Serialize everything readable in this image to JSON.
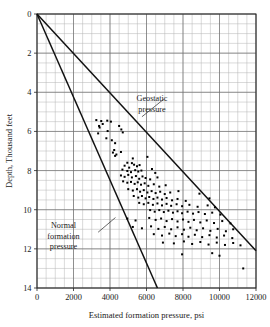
{
  "chart_data": {
    "type": "scatter",
    "title": "",
    "xlabel": "Estimated formation pressure, psi",
    "ylabel": "Depth, Thousand feet",
    "xlim": [
      0,
      12000
    ],
    "ylim": [
      0,
      14
    ],
    "y_inverted": true,
    "grid": true,
    "grid_major_x": [
      0,
      2000,
      4000,
      6000,
      8000,
      10000,
      12000
    ],
    "grid_minor_x_step": 500,
    "grid_major_y": [
      0,
      2,
      4,
      6,
      8,
      10,
      12,
      14
    ],
    "grid_minor_y_step": 0.5,
    "xticks": [
      "0",
      "2000",
      "4000",
      "6000",
      "8000",
      "10000",
      "12000"
    ],
    "yticks": [
      "0",
      "2",
      "4",
      "6",
      "8",
      "10",
      "12",
      "14"
    ],
    "legend_position": "inline-annotations",
    "annotations": [
      {
        "name": "geostatic-pressure-label",
        "text_lines": [
          "Geostatic",
          "pressure"
        ],
        "text_x": 6300,
        "text_y": 4.45,
        "leader_from_x": 5750,
        "leader_from_y": 5.25,
        "leader_to_x": 6950,
        "leader_to_y": 4.35
      },
      {
        "name": "normal-formation-pressure-label",
        "text_lines": [
          "Normal",
          "formation",
          "pressure"
        ],
        "text_x": 1450,
        "text_y": 10.95,
        "leader_from_x": 4300,
        "leader_from_y": 10.4,
        "leader_to_x": 3350,
        "leader_to_y": 11.15
      }
    ],
    "series": [
      {
        "name": "Geostatic pressure",
        "type": "line",
        "points": [
          [
            0,
            0
          ],
          [
            12000,
            12.1
          ]
        ]
      },
      {
        "name": "Normal formation pressure",
        "type": "line",
        "points": [
          [
            0,
            0
          ],
          [
            6600,
            14.0
          ]
        ]
      },
      {
        "name": "Estimated formation pressure data",
        "type": "scatter",
        "marker": "square",
        "points": [
          [
            3250,
            5.42
          ],
          [
            3520,
            5.47
          ],
          [
            3850,
            5.45
          ],
          [
            4050,
            5.5
          ],
          [
            3400,
            5.72
          ],
          [
            3430,
            5.8
          ],
          [
            3600,
            5.62
          ],
          [
            4500,
            5.72
          ],
          [
            3350,
            6.1
          ],
          [
            3870,
            5.98
          ],
          [
            4620,
            5.9
          ],
          [
            4700,
            6.05
          ],
          [
            3800,
            6.35
          ],
          [
            4100,
            6.45
          ],
          [
            4280,
            6.6
          ],
          [
            4230,
            6.95
          ],
          [
            4160,
            7.08
          ],
          [
            4280,
            7.25
          ],
          [
            4350,
            7.18
          ],
          [
            4600,
            7.05
          ],
          [
            5250,
            7.38
          ],
          [
            6050,
            7.3
          ],
          [
            4950,
            7.6
          ],
          [
            5200,
            7.62
          ],
          [
            4800,
            7.75
          ],
          [
            5050,
            7.85
          ],
          [
            5320,
            7.7
          ],
          [
            5480,
            7.78
          ],
          [
            5620,
            7.72
          ],
          [
            4680,
            7.95
          ],
          [
            4950,
            8.02
          ],
          [
            5150,
            8.08
          ],
          [
            5380,
            7.98
          ],
          [
            5550,
            8.05
          ],
          [
            5720,
            8.0
          ],
          [
            6300,
            7.92
          ],
          [
            6480,
            8.12
          ],
          [
            4600,
            8.25
          ],
          [
            4800,
            8.32
          ],
          [
            5000,
            8.22
          ],
          [
            5200,
            8.35
          ],
          [
            5420,
            8.28
          ],
          [
            5600,
            8.42
          ],
          [
            5780,
            8.3
          ],
          [
            5950,
            8.38
          ],
          [
            6200,
            8.45
          ],
          [
            6600,
            8.35
          ],
          [
            4720,
            8.55
          ],
          [
            4950,
            8.62
          ],
          [
            5150,
            8.58
          ],
          [
            5350,
            8.68
          ],
          [
            5520,
            8.6
          ],
          [
            5700,
            8.72
          ],
          [
            5900,
            8.65
          ],
          [
            6100,
            8.78
          ],
          [
            6400,
            8.7
          ],
          [
            6700,
            8.82
          ],
          [
            7050,
            8.75
          ],
          [
            5000,
            8.95
          ],
          [
            5250,
            9.02
          ],
          [
            5480,
            8.95
          ],
          [
            5650,
            9.08
          ],
          [
            5850,
            9.0
          ],
          [
            6050,
            9.12
          ],
          [
            6280,
            9.05
          ],
          [
            6500,
            9.15
          ],
          [
            6750,
            9.08
          ],
          [
            7000,
            9.2
          ],
          [
            7300,
            9.12
          ],
          [
            7750,
            9.05
          ],
          [
            8900,
            9.18
          ],
          [
            5300,
            9.3
          ],
          [
            5550,
            9.38
          ],
          [
            5750,
            9.3
          ],
          [
            5950,
            9.42
          ],
          [
            6150,
            9.35
          ],
          [
            6380,
            9.45
          ],
          [
            6600,
            9.38
          ],
          [
            6850,
            9.48
          ],
          [
            7100,
            9.4
          ],
          [
            7400,
            9.52
          ],
          [
            7700,
            9.45
          ],
          [
            8150,
            9.55
          ],
          [
            9450,
            9.42
          ],
          [
            5600,
            9.65
          ],
          [
            5850,
            9.72
          ],
          [
            6100,
            9.65
          ],
          [
            6350,
            9.75
          ],
          [
            6600,
            9.68
          ],
          [
            6850,
            9.78
          ],
          [
            7100,
            9.7
          ],
          [
            7350,
            9.8
          ],
          [
            7650,
            9.72
          ],
          [
            7950,
            9.82
          ],
          [
            8350,
            9.75
          ],
          [
            8800,
            9.85
          ],
          [
            9350,
            9.78
          ],
          [
            9750,
            9.88
          ],
          [
            6200,
            10.02
          ],
          [
            6450,
            10.1
          ],
          [
            6700,
            10.02
          ],
          [
            6950,
            10.12
          ],
          [
            7200,
            10.05
          ],
          [
            7450,
            10.15
          ],
          [
            7700,
            10.08
          ],
          [
            7950,
            10.18
          ],
          [
            8250,
            10.1
          ],
          [
            8550,
            10.2
          ],
          [
            8850,
            10.12
          ],
          [
            9200,
            10.22
          ],
          [
            9600,
            10.15
          ],
          [
            10050,
            10.25
          ],
          [
            4950,
            10.45
          ],
          [
            5400,
            10.55
          ],
          [
            6150,
            10.42
          ],
          [
            6500,
            10.52
          ],
          [
            6800,
            10.45
          ],
          [
            7100,
            10.58
          ],
          [
            7400,
            10.48
          ],
          [
            7700,
            10.6
          ],
          [
            8000,
            10.5
          ],
          [
            8300,
            10.62
          ],
          [
            8600,
            10.52
          ],
          [
            8950,
            10.65
          ],
          [
            9300,
            10.55
          ],
          [
            9700,
            10.68
          ],
          [
            10150,
            10.58
          ],
          [
            10600,
            10.7
          ],
          [
            5250,
            10.88
          ],
          [
            5750,
            10.95
          ],
          [
            6250,
            10.85
          ],
          [
            6650,
            10.98
          ],
          [
            7000,
            10.88
          ],
          [
            7350,
            11.0
          ],
          [
            7700,
            10.9
          ],
          [
            8050,
            11.02
          ],
          [
            8400,
            10.92
          ],
          [
            8750,
            11.05
          ],
          [
            9100,
            10.95
          ],
          [
            9500,
            11.08
          ],
          [
            9900,
            10.98
          ],
          [
            10350,
            11.1
          ],
          [
            10750,
            11.0
          ],
          [
            6400,
            11.25
          ],
          [
            6850,
            11.32
          ],
          [
            7250,
            11.22
          ],
          [
            7600,
            11.35
          ],
          [
            7950,
            11.25
          ],
          [
            8300,
            11.38
          ],
          [
            8650,
            11.28
          ],
          [
            9050,
            11.4
          ],
          [
            9450,
            11.3
          ],
          [
            9850,
            11.42
          ],
          [
            10250,
            11.32
          ],
          [
            10700,
            11.45
          ],
          [
            6900,
            11.68
          ],
          [
            7500,
            11.72
          ],
          [
            8050,
            11.62
          ],
          [
            8500,
            11.75
          ],
          [
            8950,
            11.65
          ],
          [
            9400,
            11.78
          ],
          [
            9850,
            11.68
          ],
          [
            10300,
            11.8
          ],
          [
            10750,
            11.7
          ],
          [
            11150,
            11.82
          ],
          [
            7950,
            12.28
          ],
          [
            9600,
            12.22
          ],
          [
            10000,
            12.35
          ],
          [
            11300,
            13.0
          ]
        ]
      }
    ]
  },
  "geometry": {
    "plot_left": 37,
    "plot_right": 256,
    "plot_top": 14,
    "plot_bottom": 288
  }
}
